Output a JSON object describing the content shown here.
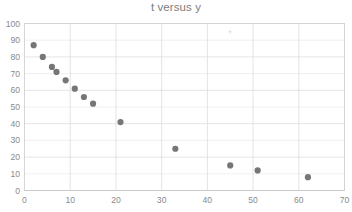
{
  "chart_data": {
    "type": "scatter",
    "title": "t versus y",
    "xlabel": "",
    "ylabel": "",
    "xlim": [
      0,
      70
    ],
    "ylim": [
      0,
      100
    ],
    "xticks": [
      0,
      10,
      20,
      30,
      40,
      50,
      60,
      70
    ],
    "yticks": [
      0,
      10,
      20,
      30,
      40,
      50,
      60,
      70,
      80,
      90,
      100
    ],
    "xtick_labels": [
      "0",
      "10",
      "20",
      "30",
      "40",
      "50",
      "60",
      "70"
    ],
    "ytick_labels": [
      "0",
      "10",
      "20",
      "30",
      "40",
      "50",
      "60",
      "70",
      "80",
      "90",
      "100"
    ],
    "grid": true,
    "legend": false,
    "legend_position": "none",
    "marker_color": "#767676",
    "marker_size": 5,
    "series": [
      {
        "name": "y",
        "x": [
          2,
          4,
          6,
          7,
          9,
          11,
          13,
          15,
          21,
          33,
          45,
          51,
          62
        ],
        "y": [
          87,
          80,
          74,
          71,
          66,
          61,
          56,
          52,
          41,
          25,
          15,
          12,
          8
        ]
      }
    ]
  },
  "colors": {
    "marker": "#767676",
    "gridline": "#e4e4e4",
    "border": "#d2d2d2",
    "text": "#808080",
    "background": "#ffffff"
  },
  "artifact": {
    "label": "faint-speck"
  }
}
